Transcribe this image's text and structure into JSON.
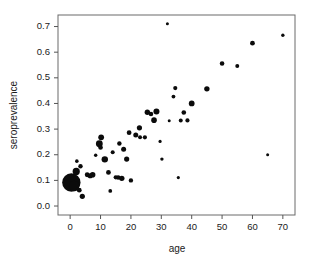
{
  "chart_data": {
    "type": "scatter",
    "title": "",
    "xlabel": "age",
    "ylabel": "seroprevalence",
    "xlim": [
      -4,
      74
    ],
    "ylim": [
      -0.035,
      0.745
    ],
    "xticks": [
      0,
      10,
      20,
      30,
      40,
      50,
      60,
      70
    ],
    "yticks": [
      0.0,
      0.1,
      0.2,
      0.3,
      0.4,
      0.5,
      0.6,
      0.7
    ],
    "xtick_labels": [
      "0",
      "10",
      "20",
      "30",
      "40",
      "50",
      "60",
      "70"
    ],
    "ytick_labels": [
      "0.0",
      "0.1",
      "0.2",
      "0.3",
      "0.4",
      "0.5",
      "0.6",
      "0.7"
    ],
    "grid": false,
    "legend": null,
    "marker_color": "#0b0b0b",
    "marker_note": "point area proportional to sample size",
    "points": [
      {
        "x": 0.4,
        "y": 0.092,
        "size": 9.2
      },
      {
        "x": 1.3,
        "y": 0.078,
        "size": 5.2
      },
      {
        "x": 2.0,
        "y": 0.135,
        "size": 3.6
      },
      {
        "x": 2.2,
        "y": 0.175,
        "size": 1.8
      },
      {
        "x": 3.4,
        "y": 0.155,
        "size": 2.2
      },
      {
        "x": 3.0,
        "y": 0.062,
        "size": 2.4
      },
      {
        "x": 4.0,
        "y": 0.038,
        "size": 2.6
      },
      {
        "x": 5.6,
        "y": 0.122,
        "size": 2.4
      },
      {
        "x": 6.6,
        "y": 0.118,
        "size": 2.6
      },
      {
        "x": 7.4,
        "y": 0.122,
        "size": 2.8
      },
      {
        "x": 8.4,
        "y": 0.198,
        "size": 1.7
      },
      {
        "x": 9.6,
        "y": 0.243,
        "size": 3.4
      },
      {
        "x": 10.2,
        "y": 0.268,
        "size": 2.9
      },
      {
        "x": 10.0,
        "y": 0.228,
        "size": 2.3
      },
      {
        "x": 11.4,
        "y": 0.182,
        "size": 3.2
      },
      {
        "x": 12.6,
        "y": 0.131,
        "size": 2.4
      },
      {
        "x": 13.2,
        "y": 0.059,
        "size": 1.9
      },
      {
        "x": 14.0,
        "y": 0.21,
        "size": 2.0
      },
      {
        "x": 15.0,
        "y": 0.112,
        "size": 2.1
      },
      {
        "x": 15.8,
        "y": 0.111,
        "size": 2.3
      },
      {
        "x": 16.2,
        "y": 0.244,
        "size": 2.2
      },
      {
        "x": 17.0,
        "y": 0.108,
        "size": 2.7
      },
      {
        "x": 17.6,
        "y": 0.221,
        "size": 2.5
      },
      {
        "x": 18.6,
        "y": 0.183,
        "size": 2.6
      },
      {
        "x": 19.4,
        "y": 0.286,
        "size": 2.4
      },
      {
        "x": 20.0,
        "y": 0.1,
        "size": 2.2
      },
      {
        "x": 21.6,
        "y": 0.277,
        "size": 2.5
      },
      {
        "x": 22.8,
        "y": 0.305,
        "size": 2.6
      },
      {
        "x": 23.0,
        "y": 0.268,
        "size": 2.0
      },
      {
        "x": 24.6,
        "y": 0.268,
        "size": 2.1
      },
      {
        "x": 25.4,
        "y": 0.366,
        "size": 2.7
      },
      {
        "x": 26.6,
        "y": 0.359,
        "size": 2.3
      },
      {
        "x": 27.6,
        "y": 0.335,
        "size": 2.8
      },
      {
        "x": 28.4,
        "y": 0.369,
        "size": 3.0
      },
      {
        "x": 29.6,
        "y": 0.252,
        "size": 1.6
      },
      {
        "x": 30.2,
        "y": 0.183,
        "size": 1.7
      },
      {
        "x": 32.0,
        "y": 0.711,
        "size": 1.5
      },
      {
        "x": 32.6,
        "y": 0.333,
        "size": 1.5
      },
      {
        "x": 34.0,
        "y": 0.427,
        "size": 1.9
      },
      {
        "x": 34.6,
        "y": 0.46,
        "size": 2.1
      },
      {
        "x": 35.6,
        "y": 0.111,
        "size": 1.6
      },
      {
        "x": 36.4,
        "y": 0.334,
        "size": 2.0
      },
      {
        "x": 37.4,
        "y": 0.365,
        "size": 2.3
      },
      {
        "x": 38.6,
        "y": 0.334,
        "size": 2.1
      },
      {
        "x": 40.0,
        "y": 0.4,
        "size": 2.9
      },
      {
        "x": 45.0,
        "y": 0.457,
        "size": 2.7
      },
      {
        "x": 50.0,
        "y": 0.556,
        "size": 2.3
      },
      {
        "x": 55.0,
        "y": 0.546,
        "size": 2.0
      },
      {
        "x": 60.0,
        "y": 0.635,
        "size": 2.4
      },
      {
        "x": 65.0,
        "y": 0.2,
        "size": 1.5
      },
      {
        "x": 70.0,
        "y": 0.666,
        "size": 1.7
      }
    ]
  },
  "figure": {
    "background_color": "#ffffff",
    "frame_color": "#6a6a6a"
  }
}
